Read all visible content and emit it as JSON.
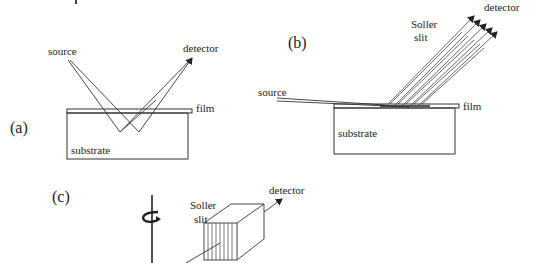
{
  "figure": {
    "panels": [
      {
        "id": "a",
        "label": "(a)",
        "labels": {
          "source": "source",
          "detector": "detector",
          "film": "film",
          "substrate": "substrate"
        }
      },
      {
        "id": "b",
        "label": "(b)",
        "labels": {
          "source": "source",
          "detector": "detector",
          "soller_line1": "Soller",
          "soller_line2": "slit",
          "film": "film",
          "substrate": "substrate"
        }
      },
      {
        "id": "c",
        "label": "(c)",
        "labels": {
          "detector": "detector",
          "soller_line1": "Soller",
          "soller_line2": "slit"
        }
      }
    ],
    "colors": {
      "line": "#333333",
      "text": "#222222",
      "background": "#ffffff"
    }
  }
}
